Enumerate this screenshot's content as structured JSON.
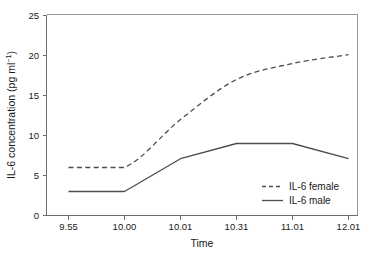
{
  "chart_data": {
    "type": "line",
    "title": "",
    "xlabel": "Time",
    "ylabel": "IL-6 concentration (pg ml⁻¹)",
    "categories": [
      "9.55",
      "10.00",
      "10.01",
      "10.31",
      "11.01",
      "12.01"
    ],
    "xticklabels": [
      "9.55",
      "10.00",
      "10.01",
      "10.31",
      "11.01",
      "12.01"
    ],
    "yticklabels": [
      "0",
      "5",
      "10",
      "15",
      "20",
      "25"
    ],
    "yticks": [
      0,
      5,
      10,
      15,
      20,
      25
    ],
    "ylim": [
      0,
      25
    ],
    "grid": false,
    "legend_position": "lower-right",
    "series": [
      {
        "name": "IL-6 female",
        "style": "dashed",
        "color": "#4d4d4d",
        "values": [
          6.0,
          6.0,
          12.0,
          17.0,
          19.0,
          20.1
        ]
      },
      {
        "name": "IL-6 male",
        "style": "solid",
        "color": "#4d4d4d",
        "values": [
          3.0,
          3.0,
          7.1,
          9.0,
          9.0,
          7.1
        ]
      }
    ]
  },
  "axes": {
    "y_axis_title": "IL-6 concentration (pg ml⁻¹)",
    "y_axis_title_main": "IL-6 concentration (pg ml",
    "y_axis_title_sup": "−1",
    "y_axis_title_tail": ")",
    "x_axis_title": "Time",
    "y_tick_labels": [
      "25",
      "20",
      "15",
      "10",
      "5",
      "0"
    ],
    "x_tick_labels": [
      "9.55",
      "10.00",
      "10.01",
      "10.31",
      "11.01",
      "12.01"
    ]
  },
  "legend": {
    "entries": [
      {
        "label": "IL-6 female",
        "style": "dashed"
      },
      {
        "label": "IL-6 male",
        "style": "solid"
      }
    ]
  },
  "colors": {
    "background": "#ffffff",
    "line": "#4d4d4d",
    "axis": "#6e6e6e",
    "frame": "#9a9a9a",
    "text": "#1a1a1a"
  }
}
